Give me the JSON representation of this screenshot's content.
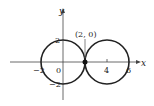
{
  "figure": {
    "axes": {
      "x_label": "x",
      "y_label": "y",
      "x_ticks": [
        {
          "value": -2,
          "label": "−2"
        },
        {
          "value": 0,
          "label": "0"
        },
        {
          "value": 4,
          "label": "4"
        },
        {
          "value": 6,
          "label": "6"
        }
      ],
      "y_ticks": [
        {
          "value": 2,
          "label": "2"
        },
        {
          "value": -2,
          "label": "−2"
        }
      ]
    },
    "curves": [
      {
        "name": "circle-left",
        "center": [
          0,
          0
        ],
        "radius": 2
      },
      {
        "name": "circle-right",
        "center": [
          4,
          0
        ],
        "radius": 2
      }
    ],
    "point": {
      "coords": [
        2,
        0
      ],
      "label": "(2, 0)"
    },
    "colors": {
      "stroke": "#222222",
      "background": "#ffffff"
    }
  }
}
